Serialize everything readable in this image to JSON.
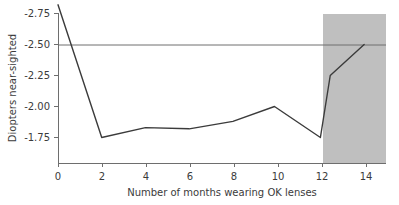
{
  "chart_data": {
    "type": "line",
    "title": "",
    "xlabel": "Number of months wearing OK lenses",
    "ylabel": "Diopters near-sighted",
    "xlim": [
      0,
      15
    ],
    "ylim": [
      -2.85,
      -1.62
    ],
    "y_axis_inverted": true,
    "grid": false,
    "legend": "none",
    "xticks": [
      0,
      2,
      4,
      6,
      8,
      10,
      12,
      14
    ],
    "xtick_labels": [
      "0",
      "2",
      "4",
      "6",
      "8",
      "10",
      "12",
      "14"
    ],
    "yticks": [
      -2.75,
      -2.5,
      -2.25,
      -2.0,
      -1.75
    ],
    "ytick_labels": [
      "-2.75",
      "-2.50",
      "-2.25",
      "-2.00",
      "-1.75"
    ],
    "series": [
      {
        "name": "Diopters near-sighted over time",
        "color": "#3b3b3b",
        "x": [
          0,
          2,
          4,
          6,
          8,
          9.9,
          12,
          12.45,
          14
        ],
        "values": [
          -2.82,
          -1.75,
          -1.83,
          -1.82,
          -1.88,
          -2.0,
          -1.75,
          -2.25,
          -2.5
        ]
      }
    ],
    "reference_line": {
      "name": "baseline-prescription",
      "orientation": "horizontal",
      "value": -2.5,
      "color": "#6e6e6e"
    },
    "shaded_region": {
      "name": "post-treatment-period",
      "x_start": 12,
      "x_end": 15,
      "color": "#bfbfbf"
    }
  },
  "axes": {
    "x_label": "Number of months wearing OK lenses",
    "y_label": "Diopters near-sighted"
  }
}
